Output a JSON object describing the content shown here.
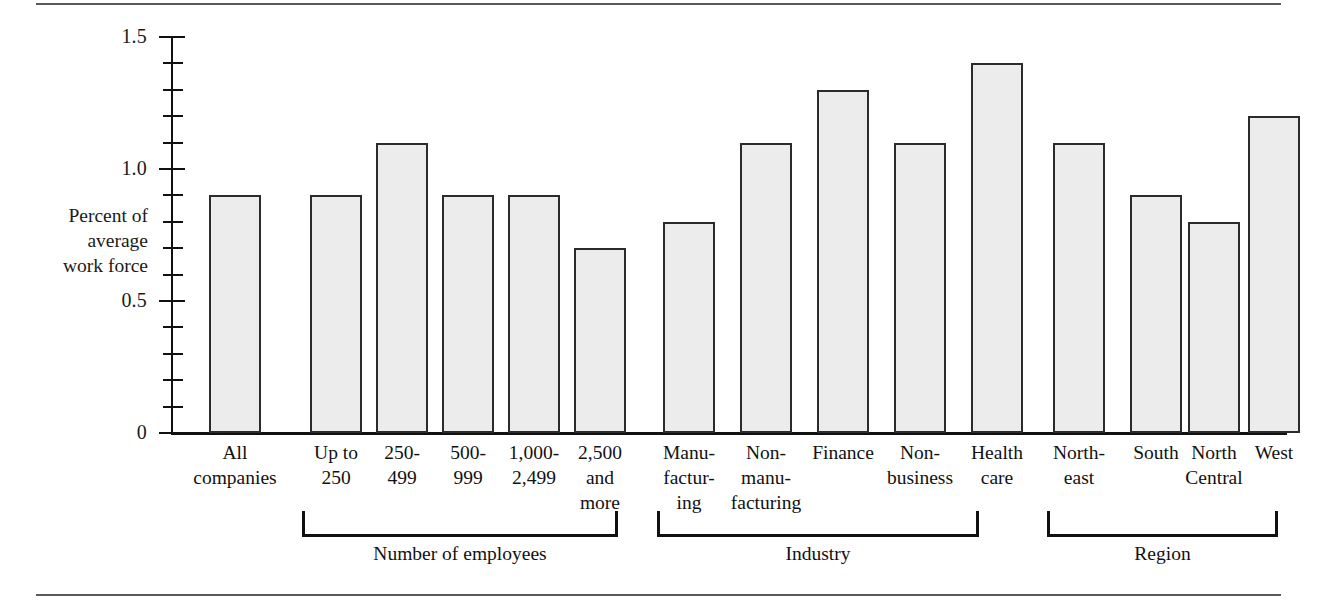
{
  "chart_data": {
    "type": "bar",
    "title": "",
    "subtitle": "",
    "xlabel": "",
    "ylabel": "Percent of average work force",
    "ylabel_lines": [
      "Percent of",
      "average",
      "work force"
    ],
    "ylim": [
      0,
      1.5
    ],
    "ytick_labels": [
      "0",
      "0.5",
      "1.0",
      "1.5"
    ],
    "ytick_values": [
      0,
      0.5,
      1.0,
      1.5
    ],
    "minor_tick_step": 0.1,
    "grid": false,
    "legend": null,
    "categories": [
      "All companies",
      "Up to 250",
      "250-499",
      "500-999",
      "1,000-2,499",
      "2,500 and more",
      "Manufacturing",
      "Non-manufacturing",
      "Finance",
      "Non-business",
      "Health care",
      "Northeast",
      "South",
      "North Central",
      "West"
    ],
    "values": [
      0.9,
      0.9,
      1.1,
      0.9,
      0.9,
      0.7,
      0.8,
      1.1,
      1.3,
      1.1,
      1.4,
      1.1,
      0.9,
      0.8,
      1.2
    ],
    "bar_fill_color": "#ececec",
    "bar_edge_color": "#2b2b2b"
  },
  "axis": {
    "y_title_lines": [
      "Percent of",
      "average",
      "work force"
    ],
    "ticks": [
      {
        "label": "1.5",
        "value": 1.5
      },
      {
        "label": "1.0",
        "value": 1.0
      },
      {
        "label": "0.5",
        "value": 0.5
      },
      {
        "label": "0",
        "value": 0
      }
    ]
  },
  "bars": [
    {
      "label_lines": [
        "All",
        "companies"
      ],
      "value": 0.9
    },
    {
      "label_lines": [
        "Up to",
        "250"
      ],
      "value": 0.9
    },
    {
      "label_lines": [
        "250-",
        "499"
      ],
      "value": 1.1
    },
    {
      "label_lines": [
        "500-",
        "999"
      ],
      "value": 0.9
    },
    {
      "label_lines": [
        "1,000-",
        "2,499"
      ],
      "value": 0.9
    },
    {
      "label_lines": [
        "2,500",
        "and",
        "more"
      ],
      "value": 0.7
    },
    {
      "label_lines": [
        "Manu-",
        "factur-",
        "ing"
      ],
      "value": 0.8
    },
    {
      "label_lines": [
        "Non-",
        "manu-",
        "facturing"
      ],
      "value": 1.1
    },
    {
      "label_lines": [
        "Finance"
      ],
      "value": 1.3
    },
    {
      "label_lines": [
        "Non-",
        "business"
      ],
      "value": 1.1
    },
    {
      "label_lines": [
        "Health",
        "care"
      ],
      "value": 1.4
    },
    {
      "label_lines": [
        "North-",
        "east"
      ],
      "value": 1.1
    },
    {
      "label_lines": [
        "South"
      ],
      "value": 0.9
    },
    {
      "label_lines": [
        "North",
        "Central"
      ],
      "value": 0.8
    },
    {
      "label_lines": [
        "West"
      ],
      "value": 1.2
    }
  ],
  "groups": [
    {
      "label": "Number of employees",
      "first": 1,
      "last": 5
    },
    {
      "label": "Industry",
      "first": 6,
      "last": 10
    },
    {
      "label": "Region",
      "first": 11,
      "last": 14
    }
  ]
}
